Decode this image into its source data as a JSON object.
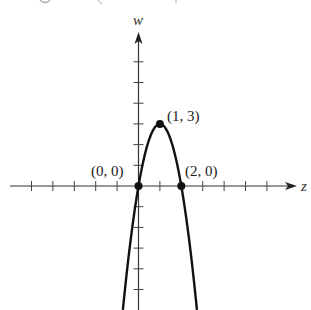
{
  "chart_data": {
    "type": "line",
    "title": "",
    "xlabel": "z",
    "ylabel": "w",
    "function": "w = -3z^2 + 6z",
    "xlim": [
      -6,
      7
    ],
    "ylim": [
      -6,
      7
    ],
    "x_ticks": [
      -5,
      -4,
      -3,
      -2,
      -1,
      0,
      1,
      2,
      3,
      4,
      5,
      6
    ],
    "y_ticks": [
      -5,
      -4,
      -3,
      -2,
      -1,
      0,
      1,
      2,
      3,
      4,
      5,
      6
    ],
    "grid": false,
    "legend": false,
    "series": [
      {
        "name": "parabola",
        "x": [
          -0.73,
          -0.5,
          0,
          0.25,
          0.5,
          0.75,
          1,
          1.25,
          1.5,
          1.75,
          2,
          2.5,
          2.73
        ],
        "y": [
          -6.0,
          -3.75,
          0,
          1.31,
          2.25,
          2.81,
          3,
          2.81,
          2.25,
          1.31,
          0,
          -3.75,
          -6.0
        ]
      }
    ],
    "points": [
      {
        "label": "(0, 0)",
        "x": 0,
        "y": 0
      },
      {
        "label": "(1, 3)",
        "x": 1,
        "y": 3
      },
      {
        "label": "(2, 0)",
        "x": 2,
        "y": 0
      }
    ]
  },
  "labels": {
    "x_axis": "z",
    "y_axis": "w",
    "point_origin": "(0, 0)",
    "point_vertex": "(1, 3)",
    "point_root2": "(2, 0)"
  },
  "style": {
    "ink": "#111111",
    "axis": "#333333"
  }
}
